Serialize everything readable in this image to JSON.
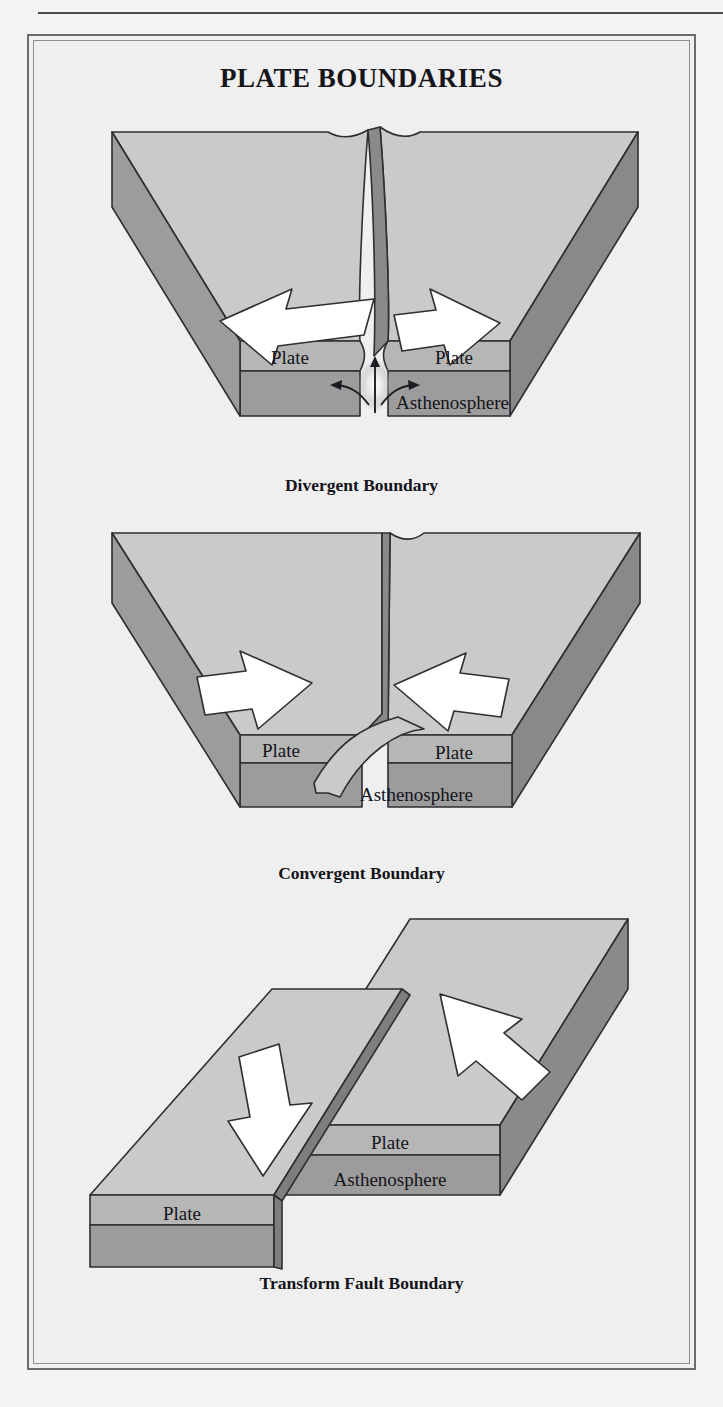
{
  "page": {
    "title": "PLATE BOUNDARIES",
    "background_color": "#f3f3f3",
    "frame_color": "#6b6b6b"
  },
  "palette": {
    "plate_top": "#c8c8c8",
    "plate_top_light": "#d2d2d2",
    "plate_band": "#b6b6b6",
    "asthenosphere_face": "#9c9c9c",
    "side_dark": "#8a8a8a",
    "side_darker": "#7c7c7c",
    "outline": "#2e2e33",
    "arrow_fill": "#ffffff"
  },
  "diagrams": [
    {
      "id": "divergent",
      "caption": "Divergent Boundary",
      "labels": {
        "plate_left": "Plate",
        "plate_right": "Plate",
        "asthenosphere": "Asthenosphere"
      },
      "arrows": [
        {
          "name": "arrow-left",
          "direction": "left",
          "meaning": "plate moves away from ridge"
        },
        {
          "name": "arrow-right",
          "direction": "right",
          "meaning": "plate moves away from ridge"
        }
      ],
      "features": [
        "rift-valley",
        "upwelling-magma-plume",
        "mantle-flow-arrows"
      ]
    },
    {
      "id": "convergent",
      "caption": "Convergent Boundary",
      "labels": {
        "plate_left": "Plate",
        "plate_right": "Plate",
        "asthenosphere": "Asthenosphere"
      },
      "arrows": [
        {
          "name": "arrow-right",
          "direction": "right",
          "meaning": "plate moves toward boundary"
        },
        {
          "name": "arrow-left",
          "direction": "left",
          "meaning": "plate moves toward boundary"
        }
      ],
      "features": [
        "subducting-slab",
        "trench"
      ]
    },
    {
      "id": "transform",
      "caption": "Transform Fault Boundary",
      "labels": {
        "plate_left": "Plate",
        "plate_right": "Plate",
        "asthenosphere": "Asthenosphere"
      },
      "arrows": [
        {
          "name": "arrow-down",
          "direction": "down",
          "meaning": "plate slides one way"
        },
        {
          "name": "arrow-up",
          "direction": "up",
          "meaning": "plate slides opposite way"
        }
      ],
      "features": [
        "strike-slip-fault",
        "offset-blocks"
      ]
    }
  ]
}
